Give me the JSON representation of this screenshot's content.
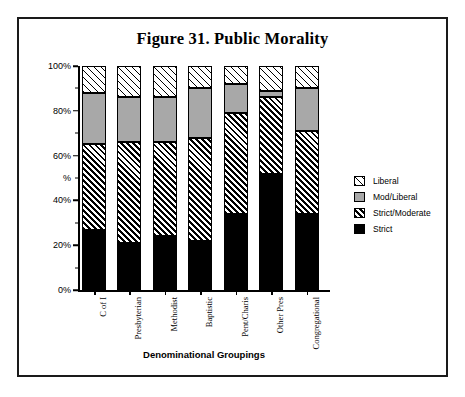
{
  "figure": {
    "title": "Figure 31. Public Morality"
  },
  "axes": {
    "y_label": "%",
    "x_title": "Denominational Groupings",
    "y_ticks": [
      "0%",
      "20%",
      "40%",
      "60%",
      "80%",
      "100%"
    ]
  },
  "legend": {
    "items": [
      {
        "label": "Liberal",
        "swatch": "light-hatch-swatch",
        "color": "#ffffff"
      },
      {
        "label": "Mod/Liberal",
        "swatch": "gray-swatch",
        "color": "#a8a8a8"
      },
      {
        "label": "Strict/Moderate",
        "swatch": "dense-hatch-swatch",
        "color": "#ffffff"
      },
      {
        "label": "Strict",
        "swatch": "black-swatch",
        "color": "#000000"
      }
    ]
  },
  "chart_data": {
    "type": "bar",
    "stacked": true,
    "title": "Figure 31. Public Morality",
    "xlabel": "Denominational Groupings",
    "ylabel": "%",
    "ylim": [
      0,
      100
    ],
    "ytick_values": [
      0,
      20,
      40,
      60,
      80,
      100
    ],
    "ytick_labels": [
      "0%",
      "20%",
      "40%",
      "60%",
      "80%",
      "100%"
    ],
    "grid": false,
    "legend_position": "right",
    "categories": [
      "C of I",
      "Presbyterian",
      "Methodist",
      "Baptistic",
      "Pent/Charis",
      "Other Pres",
      "Congregational"
    ],
    "series": [
      {
        "name": "Strict",
        "values": [
          27,
          21,
          24,
          22,
          34,
          52,
          34
        ]
      },
      {
        "name": "Strict/Moderate",
        "values": [
          38,
          45,
          42,
          46,
          45,
          34,
          37
        ]
      },
      {
        "name": "Mod/Liberal",
        "values": [
          23,
          20,
          20,
          22,
          13,
          3,
          19
        ]
      },
      {
        "name": "Liberal",
        "values": [
          12,
          14,
          14,
          10,
          8,
          11,
          10
        ]
      }
    ],
    "cumulative_tops": {
      "Strict": [
        27,
        21,
        24,
        22,
        34,
        52,
        34
      ],
      "Strict/Moderate": [
        65,
        66,
        66,
        68,
        79,
        86,
        71
      ],
      "Mod/Liberal": [
        88,
        86,
        86,
        90,
        92,
        89,
        90
      ],
      "Liberal": [
        100,
        100,
        100,
        100,
        100,
        100,
        100
      ]
    }
  }
}
